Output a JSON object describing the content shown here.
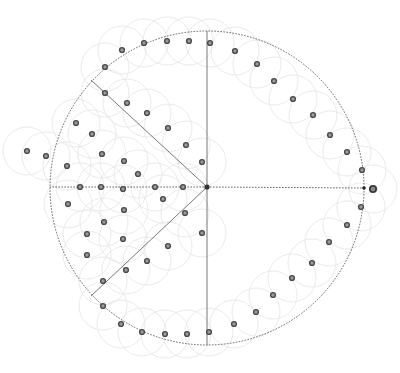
{
  "diagram": {
    "type": "sector-partitioned disk with sample points",
    "colors": {
      "background": "#ffffff",
      "boundary": "#555555",
      "radial_lines": "#6a6a6a",
      "halo": "#e4e4e4",
      "point_stroke": "#4a4a4a",
      "point_fill": "#9a9a9a"
    },
    "disk": {
      "cx": 207,
      "cy": 188,
      "r": 157
    },
    "halo_radius": 24,
    "radial_lines": [
      {
        "name": "up",
        "x2": 207,
        "y2": 31,
        "style": "solid"
      },
      {
        "name": "down",
        "x2": 207,
        "y2": 345,
        "style": "solid"
      },
      {
        "name": "upper-left",
        "x2": 91,
        "y2": 80,
        "style": "solid"
      },
      {
        "name": "lower-left",
        "x2": 91,
        "y2": 296,
        "style": "solid"
      },
      {
        "name": "left",
        "x2": 50,
        "y2": 187,
        "style": "dotted"
      },
      {
        "name": "right",
        "x2": 364,
        "y2": 188,
        "style": "dotted"
      }
    ],
    "center_point": {
      "x": 207,
      "y": 187
    },
    "end_point": {
      "x": 364,
      "y": 188
    },
    "outside_point": {
      "x": 373,
      "y": 189
    },
    "points": [
      [
        105,
        67
      ],
      [
        122,
        50
      ],
      [
        144,
        43
      ],
      [
        167,
        41
      ],
      [
        189,
        41
      ],
      [
        210,
        43
      ],
      [
        235,
        51
      ],
      [
        257,
        64
      ],
      [
        274,
        81
      ],
      [
        293,
        99
      ],
      [
        313,
        115
      ],
      [
        330,
        135
      ],
      [
        347,
        152
      ],
      [
        362,
        170
      ],
      [
        361,
        207
      ],
      [
        347,
        225
      ],
      [
        329,
        242
      ],
      [
        312,
        263
      ],
      [
        292,
        278
      ],
      [
        273,
        295
      ],
      [
        256,
        312
      ],
      [
        234,
        324
      ],
      [
        209,
        332
      ],
      [
        187,
        334
      ],
      [
        165,
        334
      ],
      [
        142,
        332
      ],
      [
        121,
        324
      ],
      [
        103,
        306
      ],
      [
        105,
        93
      ],
      [
        127,
        103
      ],
      [
        147,
        113
      ],
      [
        168,
        128
      ],
      [
        186,
        145
      ],
      [
        202,
        162
      ],
      [
        76,
        123
      ],
      [
        92,
        134
      ],
      [
        102,
        154
      ],
      [
        124,
        161
      ],
      [
        138,
        174
      ],
      [
        67,
        166
      ],
      [
        46,
        156
      ],
      [
        27,
        151
      ],
      [
        80,
        187
      ],
      [
        101,
        187
      ],
      [
        123,
        189
      ],
      [
        155,
        187
      ],
      [
        183,
        187
      ],
      [
        68,
        204
      ],
      [
        124,
        210
      ],
      [
        104,
        222
      ],
      [
        87,
        234
      ],
      [
        123,
        239
      ],
      [
        87,
        255
      ],
      [
        163,
        199
      ],
      [
        185,
        213
      ],
      [
        202,
        233
      ],
      [
        168,
        246
      ],
      [
        147,
        261
      ],
      [
        126,
        270
      ],
      [
        103,
        281
      ]
    ]
  }
}
